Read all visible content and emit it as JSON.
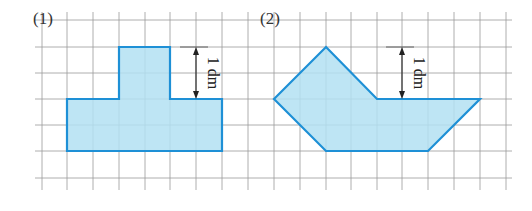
{
  "figure": {
    "grid": {
      "cell_size": 26,
      "x_lines": [
        42,
        67,
        93,
        119,
        145,
        170,
        196,
        222,
        248,
        274,
        300,
        326,
        351,
        377,
        402,
        428,
        454,
        480,
        506
      ],
      "y_lines": [
        20,
        47,
        73,
        99,
        125,
        151,
        178
      ],
      "x_extent": [
        35,
        512
      ],
      "y_extent": [
        12,
        190
      ],
      "line_color": "#9a9a9a"
    },
    "colors": {
      "fill": "#b3e0f2",
      "stroke": "#1e90d6",
      "arrow": "#222222"
    },
    "shapes": [
      {
        "label": "(1)",
        "label_pos": [
          33,
          10
        ],
        "points": [
          [
            67,
            99
          ],
          [
            119,
            99
          ],
          [
            119,
            47
          ],
          [
            170,
            47
          ],
          [
            170,
            99
          ],
          [
            222,
            99
          ],
          [
            222,
            151
          ],
          [
            67,
            151
          ]
        ],
        "dimension": {
          "text": "1 dm",
          "x": 196,
          "y1": 47,
          "y2": 99,
          "tick_x1": 180,
          "tick_x2": 208,
          "text_x": 212
        }
      },
      {
        "label": "(2)",
        "label_pos": [
          260,
          10
        ],
        "points": [
          [
            326,
            47
          ],
          [
            377,
            99
          ],
          [
            480,
            99
          ],
          [
            428,
            151
          ],
          [
            326,
            151
          ],
          [
            274,
            99
          ]
        ],
        "dimension": {
          "text": "1 dm",
          "x": 402,
          "y1": 47,
          "y2": 99,
          "tick_x1": 386,
          "tick_x2": 414,
          "text_x": 418
        }
      }
    ]
  }
}
